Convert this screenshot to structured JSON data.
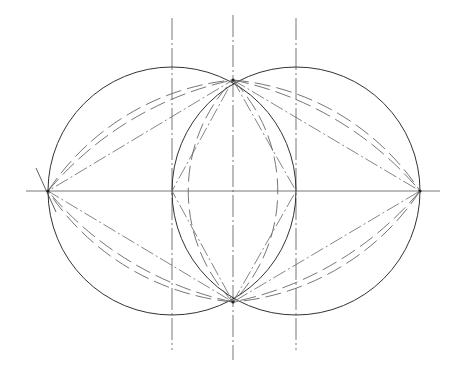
{
  "figure": {
    "width": 464,
    "height": 370,
    "background": "#ffffff",
    "stroke_color": "#333333",
    "construction_color": "#666666",
    "centerline_color": "#555555"
  },
  "geometry": {
    "circles": [
      {
        "name": "left-circle",
        "cx": 172,
        "cy": 191,
        "r": 124
      },
      {
        "name": "right-circle",
        "cx": 296,
        "cy": 191,
        "r": 124
      }
    ],
    "points": {
      "left": {
        "x": 48,
        "y": 191
      },
      "right": {
        "x": 420,
        "y": 191
      },
      "top": {
        "x": 233,
        "y": 80
      },
      "bottom": {
        "x": 233,
        "y": 302
      },
      "left_center": {
        "x": 172,
        "y": 191
      },
      "right_center": {
        "x": 296,
        "y": 191
      }
    },
    "centerlines": {
      "horizontal": {
        "x1": 26,
        "x2": 440,
        "y": 191
      },
      "vertical": [
        {
          "name": "left-vertical-centerline",
          "x": 172,
          "y1": 18,
          "y2": 350
        },
        {
          "name": "middle-vertical-centerline",
          "x": 233,
          "y1": 15,
          "y2": 360
        },
        {
          "name": "right-vertical-centerline",
          "x": 296,
          "y1": 18,
          "y2": 350
        }
      ]
    }
  }
}
